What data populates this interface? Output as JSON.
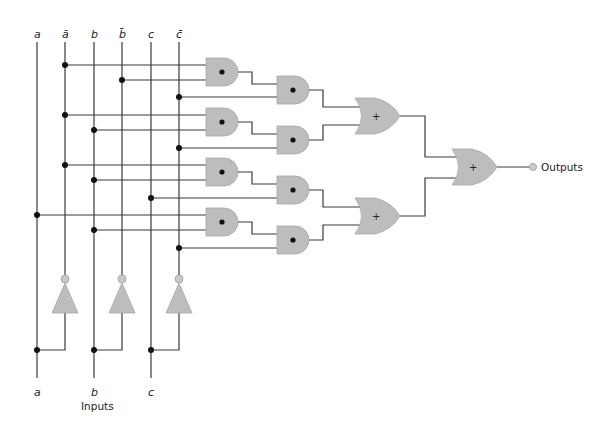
{
  "diagram": {
    "type": "combinational-logic-circuit",
    "top_labels": [
      "a",
      "ā",
      "b",
      "b̄",
      "c",
      "c̄"
    ],
    "bottom_labels": [
      "a",
      "b",
      "c"
    ],
    "inputs_caption": "Inputs",
    "outputs_caption": "Outputs",
    "and_symbol": "•",
    "or_symbol": "+",
    "gates": {
      "not": 3,
      "and": 8,
      "or": 3
    },
    "terms": [
      {
        "gates": [
          "AND1",
          "AND2"
        ],
        "inputs": [
          "ā",
          "b̄",
          "c̄"
        ]
      },
      {
        "gates": [
          "AND3",
          "AND4"
        ],
        "inputs": [
          "ā",
          "b",
          "c̄"
        ]
      },
      {
        "gates": [
          "AND5",
          "AND6"
        ],
        "inputs": [
          "ā",
          "b",
          "c"
        ]
      },
      {
        "gates": [
          "AND7",
          "AND8"
        ],
        "inputs": [
          "a",
          "b",
          "c̄"
        ]
      }
    ],
    "colors": {
      "gate_fill": "#bdbdbd",
      "wire": "#3a3a3a",
      "junction": "#111111"
    }
  }
}
